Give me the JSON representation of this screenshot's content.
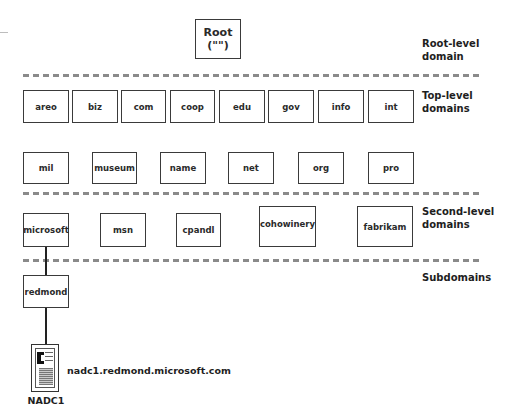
{
  "root": {
    "line1": "Root",
    "line2": "(\"\")"
  },
  "levels": {
    "root": {
      "line1": "Root-level",
      "line2": "domain"
    },
    "top": {
      "line1": "Top-level",
      "line2": "domains"
    },
    "second": {
      "line1": "Second-level",
      "line2": "domains"
    },
    "sub": {
      "line1": "Subdomains"
    }
  },
  "top_level_row1": [
    "areo",
    "biz",
    "com",
    "coop",
    "edu",
    "gov",
    "info",
    "int"
  ],
  "top_level_row2": [
    "mil",
    "museum",
    "name",
    "net",
    "org",
    "pro"
  ],
  "second_level": [
    "microsoft",
    "msn",
    "cpandl",
    "cohowinery",
    "fabrikam"
  ],
  "subdomains": [
    "redmond"
  ],
  "host": {
    "name": "NADC1",
    "fqdn": "nadc1.redmond.microsoft.com",
    "icon": "server-icon"
  },
  "colors": {
    "box_border": "#3a3a3a",
    "dash": "#8a8a8a",
    "text": "#1e1e1e"
  }
}
